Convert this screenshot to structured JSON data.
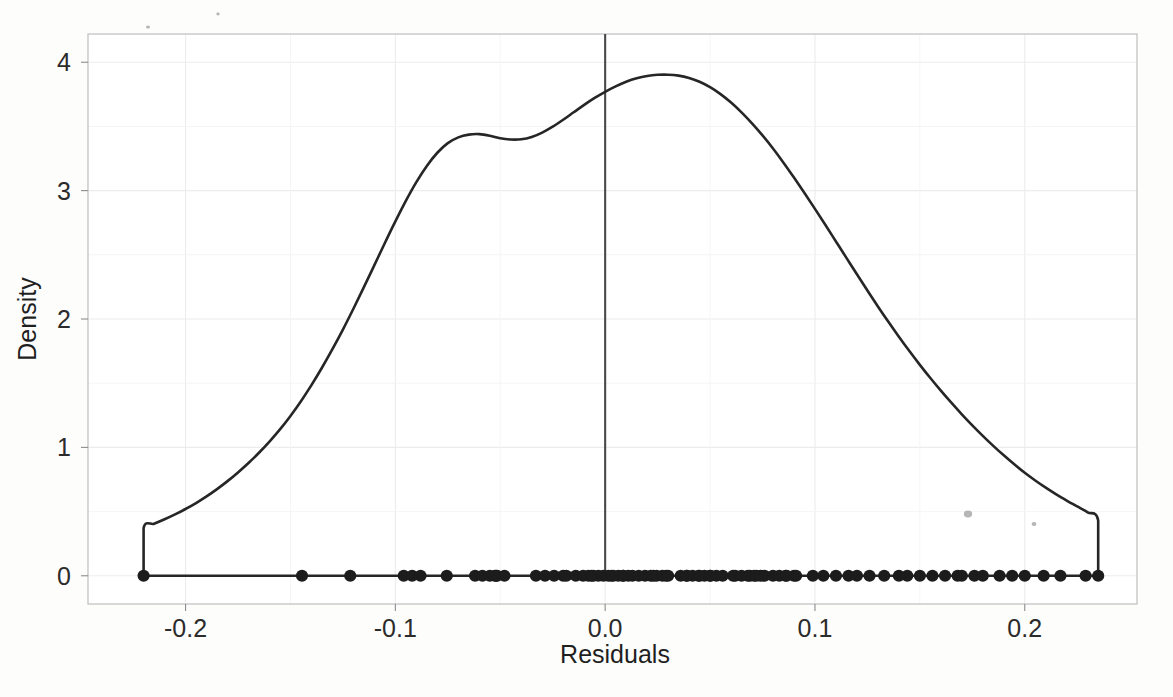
{
  "figure": {
    "name": "residual-density-plot",
    "background_color": "#fdfdfc",
    "ink_color": "#262626",
    "grid_color": "#ececec",
    "panel_border_color": "#b9b9b9",
    "vline_color": "#494949"
  },
  "axes": {
    "x_title": "Residuals",
    "y_title": "Density",
    "x_ticks": [
      "-0.2",
      "-0.1",
      "0.0",
      "0.1",
      "0.2"
    ],
    "x_tick_values": [
      -0.2,
      -0.1,
      0.0,
      0.1,
      0.2
    ],
    "y_ticks": [
      "0",
      "1",
      "2",
      "3",
      "4"
    ],
    "y_tick_values": [
      0,
      1,
      2,
      3,
      4
    ]
  },
  "annotations": {
    "reference_line_label": "0.0",
    "partial_caption_below": ""
  },
  "chart_data": {
    "type": "area",
    "plot_kind": "kernel-density-estimate-with-rug",
    "title": "",
    "subtitle": "",
    "xlabel": "Residuals",
    "ylabel": "Density",
    "xlim": [
      -0.2465,
      0.2535
    ],
    "ylim": [
      -0.22,
      4.22
    ],
    "grid": true,
    "legend": "none",
    "xticks": [
      -0.2,
      -0.1,
      0.0,
      0.1,
      0.2
    ],
    "yticks": [
      0,
      1,
      2,
      3,
      4
    ],
    "reference_lines": [
      {
        "orientation": "vertical",
        "x": 0.0,
        "y_from": 0.0,
        "y_to": 4.22,
        "color": "#494949"
      }
    ],
    "series": [
      {
        "name": "Density of residuals",
        "kind": "line",
        "color": "#262626",
        "x": [
          -0.22,
          -0.22,
          -0.215,
          -0.21,
          -0.205,
          -0.2,
          -0.195,
          -0.19,
          -0.185,
          -0.18,
          -0.175,
          -0.17,
          -0.165,
          -0.16,
          -0.155,
          -0.15,
          -0.145,
          -0.14,
          -0.135,
          -0.13,
          -0.125,
          -0.12,
          -0.115,
          -0.11,
          -0.105,
          -0.1,
          -0.095,
          -0.09,
          -0.085,
          -0.08,
          -0.075,
          -0.07,
          -0.065,
          -0.06,
          -0.055,
          -0.05,
          -0.045,
          -0.04,
          -0.035,
          -0.03,
          -0.025,
          -0.02,
          -0.015,
          -0.01,
          -0.005,
          0.0,
          0.005,
          0.01,
          0.015,
          0.02,
          0.025,
          0.03,
          0.035,
          0.04,
          0.045,
          0.05,
          0.055,
          0.06,
          0.065,
          0.07,
          0.075,
          0.08,
          0.085,
          0.09,
          0.095,
          0.1,
          0.105,
          0.11,
          0.115,
          0.12,
          0.125,
          0.13,
          0.135,
          0.14,
          0.145,
          0.15,
          0.155,
          0.16,
          0.165,
          0.17,
          0.175,
          0.18,
          0.185,
          0.19,
          0.195,
          0.2,
          0.205,
          0.21,
          0.215,
          0.22,
          0.225,
          0.23,
          0.235,
          0.235
        ],
        "y": [
          0.0,
          0.372,
          0.405,
          0.44,
          0.478,
          0.52,
          0.566,
          0.618,
          0.675,
          0.737,
          0.805,
          0.878,
          0.958,
          1.045,
          1.14,
          1.245,
          1.36,
          1.485,
          1.62,
          1.765,
          1.918,
          2.08,
          2.248,
          2.42,
          2.592,
          2.76,
          2.92,
          3.066,
          3.192,
          3.295,
          3.37,
          3.415,
          3.436,
          3.44,
          3.428,
          3.408,
          3.398,
          3.4,
          3.418,
          3.452,
          3.498,
          3.552,
          3.61,
          3.668,
          3.722,
          3.77,
          3.812,
          3.848,
          3.875,
          3.893,
          3.902,
          3.903,
          3.896,
          3.878,
          3.848,
          3.806,
          3.752,
          3.686,
          3.61,
          3.524,
          3.43,
          3.328,
          3.218,
          3.102,
          2.982,
          2.858,
          2.732,
          2.604,
          2.476,
          2.348,
          2.222,
          2.098,
          1.978,
          1.862,
          1.75,
          1.643,
          1.54,
          1.442,
          1.348,
          1.258,
          1.172,
          1.09,
          1.012,
          0.938,
          0.868,
          0.802,
          0.742,
          0.686,
          0.634,
          0.586,
          0.54,
          0.494,
          0.43,
          0.0
        ],
        "peak": {
          "x": 0.03,
          "y": 3.903
        },
        "shoulder": {
          "x": -0.06,
          "y": 3.44
        },
        "local_dip": {
          "x": -0.045,
          "y": 3.398
        },
        "value_at_zero": 3.77,
        "left_edge_value": 0.372,
        "right_edge_value": 0.43
      },
      {
        "name": "Rug of residual observations",
        "kind": "rug",
        "color": "#1c1c1c",
        "y": 0.0,
        "x": [
          -0.22,
          -0.1445,
          -0.1215,
          -0.0755,
          -0.0525,
          -0.052,
          -0.0185,
          -0.014,
          -0.0105,
          -0.0065,
          0.003,
          0.0085,
          0.013,
          0.016,
          0.023,
          0.029,
          0.039,
          0.045,
          0.05,
          0.056,
          0.061,
          0.069,
          0.072,
          0.076,
          0.08,
          0.086,
          0.091,
          0.099,
          0.104,
          0.11,
          0.116,
          0.12,
          0.126,
          0.133,
          0.14,
          0.144,
          0.15,
          0.156,
          0.162,
          0.168,
          0.17,
          0.176,
          0.18,
          0.188,
          0.194,
          0.2,
          0.209,
          0.217,
          0.229,
          0.235
        ],
        "x_dense_regions": [
          {
            "from": -0.096,
            "to": -0.088,
            "count": 3
          },
          {
            "from": -0.062,
            "to": -0.048,
            "count": 5
          },
          {
            "from": -0.033,
            "to": -0.02,
            "count": 4
          },
          {
            "from": -0.008,
            "to": 0.011,
            "count": 9
          },
          {
            "from": 0.019,
            "to": 0.03,
            "count": 5
          },
          {
            "from": 0.036,
            "to": 0.053,
            "count": 7
          },
          {
            "from": 0.062,
            "to": 0.074,
            "count": 5
          },
          {
            "from": 0.083,
            "to": 0.09,
            "count": 3
          }
        ],
        "n_observations": 118
      }
    ]
  }
}
